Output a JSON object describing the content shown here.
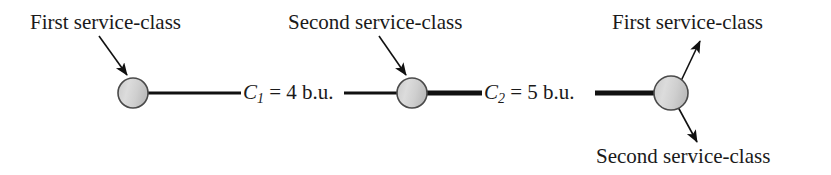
{
  "figure": {
    "type": "network-diagram",
    "background_color": "#ffffff",
    "node_fill_color": "#d2d2d2",
    "node_stroke_color": "#4a4a4a",
    "line_color": "#111111",
    "text_color": "#1a1a1a"
  },
  "labels": {
    "first_service_class_left": "First service-class",
    "second_service_class_middle": "Second service-class",
    "first_service_class_right": "First service-class",
    "second_service_class_right": "Second service-class"
  },
  "links": [
    {
      "id": "link-1",
      "variable": "C",
      "subscript": "1",
      "equals": "=",
      "value": "4",
      "unit": "b.u.",
      "full_text": "C1 = 4 b.u.",
      "thickness_px": 3
    },
    {
      "id": "link-2",
      "variable": "C",
      "subscript": "2",
      "equals": "=",
      "value": "5",
      "unit": "b.u.",
      "full_text": "C2 = 5 b.u.",
      "thickness_px": 5
    }
  ],
  "nodes": [
    {
      "id": "node-1",
      "cx": 133,
      "cy": 93,
      "r": 15
    },
    {
      "id": "node-2",
      "cx": 412,
      "cy": 93,
      "r": 15
    },
    {
      "id": "node-3",
      "cx": 671,
      "cy": 93,
      "r": 17
    }
  ]
}
